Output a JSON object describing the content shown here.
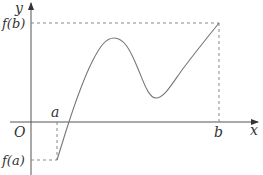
{
  "diagram": {
    "type": "function-graph",
    "colors": {
      "axis": "#555555",
      "curve": "#777777",
      "guide": "#888888",
      "text": "#333333",
      "background": "#ffffff"
    },
    "axes": {
      "x_label": "x",
      "y_label": "y",
      "origin_label": "O"
    },
    "points": {
      "a_label": "a",
      "b_label": "b",
      "fa_label": "f(a)",
      "fb_label": "f(b)"
    },
    "curve": {
      "start": "(a, f(a))",
      "end": "(b, f(b))",
      "features": [
        "rises through x-axis just right of a",
        "local maximum",
        "local minimum above x-axis",
        "rises to f(b)"
      ]
    }
  }
}
